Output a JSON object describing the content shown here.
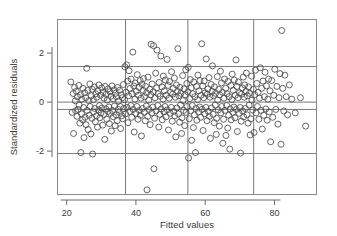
{
  "chart_data": {
    "type": "scatter",
    "title": "",
    "subtitle": "",
    "xlabel": "Fitted values",
    "ylabel": "Standardized residuals",
    "xlim": [
      17.5,
      92.0
    ],
    "ylim": [
      -3.75,
      3.35
    ],
    "xticks": [
      20,
      40,
      60,
      80
    ],
    "xtick_labels": [
      "20",
      "40",
      "60",
      "80"
    ],
    "yticks": [
      2,
      0,
      -2
    ],
    "ytick_labels": [
      "2",
      "0",
      "-2"
    ],
    "grid": true,
    "grid_vertical_x": [
      37,
      55,
      74
    ],
    "grid_horizontal_y": [
      1.45,
      0.0,
      -0.3,
      -2.1
    ],
    "legend": null,
    "legend_position": "none",
    "marker": "open-circle",
    "marker_size": 3,
    "marker_color": "#4a4a4a",
    "frame_color": "#8a8a8a",
    "grid_color": "#7a7a7a",
    "axis_color": "#6a6a6a",
    "n_points": 392,
    "points": [
      [
        21.2,
        0.82
      ],
      [
        21.6,
        -0.42
      ],
      [
        21.9,
        0.35
      ],
      [
        22.0,
        -1.28
      ],
      [
        22.3,
        0.6
      ],
      [
        22.5,
        0.05
      ],
      [
        22.6,
        -0.35
      ],
      [
        22.8,
        0.44
      ],
      [
        23.0,
        -0.58
      ],
      [
        23.1,
        0.22
      ],
      [
        23.3,
        -0.3
      ],
      [
        23.5,
        0.68
      ],
      [
        23.6,
        -0.12
      ],
      [
        23.8,
        -0.86
      ],
      [
        24.0,
        0.3
      ],
      [
        24.1,
        -2.06
      ],
      [
        24.3,
        -0.48
      ],
      [
        24.4,
        0.12
      ],
      [
        24.6,
        -0.72
      ],
      [
        24.7,
        0.56
      ],
      [
        24.9,
        -0.22
      ],
      [
        25.0,
        -1.45
      ],
      [
        25.2,
        0.38
      ],
      [
        25.3,
        -0.62
      ],
      [
        25.5,
        0.18
      ],
      [
        25.6,
        -0.92
      ],
      [
        25.8,
        1.38
      ],
      [
        25.9,
        -0.34
      ],
      [
        26.1,
        0.48
      ],
      [
        26.2,
        -1.12
      ],
      [
        26.4,
        0.06
      ],
      [
        26.5,
        -0.54
      ],
      [
        26.7,
        0.74
      ],
      [
        26.8,
        -0.18
      ],
      [
        27.0,
        -1.3
      ],
      [
        27.1,
        0.26
      ],
      [
        27.3,
        -0.66
      ],
      [
        27.4,
        0.52
      ],
      [
        27.5,
        -2.12
      ],
      [
        27.7,
        0.1
      ],
      [
        27.8,
        -0.4
      ],
      [
        28.0,
        0.62
      ],
      [
        28.1,
        -0.26
      ],
      [
        28.3,
        -0.8
      ],
      [
        28.4,
        0.34
      ],
      [
        28.6,
        -0.56
      ],
      [
        28.7,
        0.2
      ],
      [
        28.9,
        -1.02
      ],
      [
        29.0,
        0.46
      ],
      [
        29.2,
        -0.32
      ],
      [
        29.3,
        0.7
      ],
      [
        29.5,
        -0.14
      ],
      [
        29.6,
        -0.64
      ],
      [
        29.8,
        0.28
      ],
      [
        29.9,
        -0.44
      ],
      [
        30.1,
        0.58
      ],
      [
        30.2,
        -0.24
      ],
      [
        30.4,
        -0.94
      ],
      [
        30.5,
        0.4
      ],
      [
        30.7,
        -0.5
      ],
      [
        30.8,
        0.16
      ],
      [
        31.0,
        -1.52
      ],
      [
        31.1,
        0.64
      ],
      [
        31.3,
        -0.28
      ],
      [
        31.4,
        0.32
      ],
      [
        31.6,
        -0.7
      ],
      [
        31.7,
        0.08
      ],
      [
        31.9,
        -0.38
      ],
      [
        32.0,
        0.54
      ],
      [
        32.2,
        -0.2
      ],
      [
        32.3,
        -0.88
      ],
      [
        32.5,
        0.42
      ],
      [
        32.6,
        -0.46
      ],
      [
        32.8,
        0.24
      ],
      [
        32.9,
        -1.18
      ],
      [
        33.1,
        0.66
      ],
      [
        33.2,
        -0.34
      ],
      [
        33.4,
        0.14
      ],
      [
        33.5,
        -0.6
      ],
      [
        33.7,
        0.5
      ],
      [
        33.8,
        -0.16
      ],
      [
        34.0,
        -0.96
      ],
      [
        34.1,
        0.36
      ],
      [
        34.3,
        -0.52
      ],
      [
        34.4,
        0.22
      ],
      [
        34.6,
        -0.76
      ],
      [
        34.7,
        0.6
      ],
      [
        34.9,
        -0.3
      ],
      [
        35.0,
        0.04
      ],
      [
        35.2,
        -0.42
      ],
      [
        35.3,
        0.48
      ],
      [
        35.5,
        -0.18
      ],
      [
        35.6,
        -1.08
      ],
      [
        35.8,
        0.3
      ],
      [
        35.9,
        -0.56
      ],
      [
        36.1,
        0.18
      ],
      [
        36.2,
        -0.68
      ],
      [
        36.4,
        0.72
      ],
      [
        36.5,
        -0.26
      ],
      [
        36.7,
        0.1
      ],
      [
        36.8,
        1.44
      ],
      [
        37.0,
        -0.48
      ],
      [
        37.1,
        0.4
      ],
      [
        37.3,
        1.52
      ],
      [
        37.4,
        -0.22
      ],
      [
        37.6,
        0.86
      ],
      [
        37.7,
        -0.84
      ],
      [
        37.9,
        0.26
      ],
      [
        38.0,
        1.28
      ],
      [
        38.2,
        -0.38
      ],
      [
        38.3,
        0.56
      ],
      [
        38.5,
        -0.14
      ],
      [
        38.6,
        0.94
      ],
      [
        38.8,
        -0.62
      ],
      [
        38.9,
        0.34
      ],
      [
        39.1,
        2.04
      ],
      [
        39.2,
        -0.3
      ],
      [
        39.4,
        0.66
      ],
      [
        39.5,
        -1.22
      ],
      [
        39.7,
        0.12
      ],
      [
        39.8,
        0.78
      ],
      [
        40.0,
        -0.46
      ],
      [
        40.1,
        0.44
      ],
      [
        40.3,
        -0.18
      ],
      [
        40.4,
        1.12
      ],
      [
        40.6,
        -0.7
      ],
      [
        40.7,
        0.28
      ],
      [
        40.9,
        0.6
      ],
      [
        41.0,
        -0.34
      ],
      [
        41.2,
        0.88
      ],
      [
        41.3,
        -0.54
      ],
      [
        41.5,
        0.16
      ],
      [
        41.6,
        -1.38
      ],
      [
        41.8,
        0.72
      ],
      [
        41.9,
        -0.26
      ],
      [
        42.1,
        0.48
      ],
      [
        42.2,
        0.96
      ],
      [
        42.4,
        -0.42
      ],
      [
        42.5,
        0.22
      ],
      [
        42.7,
        -0.76
      ],
      [
        42.8,
        0.64
      ],
      [
        43.0,
        -0.16
      ],
      [
        43.1,
        0.38
      ],
      [
        43.2,
        -3.58
      ],
      [
        43.4,
        -0.58
      ],
      [
        43.5,
        1.02
      ],
      [
        43.7,
        0.08
      ],
      [
        43.8,
        -0.3
      ],
      [
        44.0,
        0.52
      ],
      [
        44.1,
        -0.92
      ],
      [
        44.3,
        0.3
      ],
      [
        44.4,
        2.36
      ],
      [
        44.6,
        -0.44
      ],
      [
        44.7,
        0.74
      ],
      [
        44.9,
        -0.2
      ],
      [
        45.0,
        0.42
      ],
      [
        45.1,
        2.3
      ],
      [
        45.2,
        -2.72
      ],
      [
        45.4,
        -0.66
      ],
      [
        45.5,
        0.18
      ],
      [
        45.7,
        1.18
      ],
      [
        45.8,
        -0.36
      ],
      [
        46.0,
        0.58
      ],
      [
        46.1,
        2.12
      ],
      [
        46.3,
        -0.14
      ],
      [
        46.4,
        0.34
      ],
      [
        46.6,
        -1.02
      ],
      [
        46.7,
        0.8
      ],
      [
        46.9,
        -0.5
      ],
      [
        47.0,
        0.24
      ],
      [
        47.2,
        1.88
      ],
      [
        47.3,
        -0.28
      ],
      [
        47.5,
        0.62
      ],
      [
        47.6,
        -0.72
      ],
      [
        47.8,
        0.12
      ],
      [
        47.9,
        1.06
      ],
      [
        48.1,
        -0.4
      ],
      [
        48.2,
        0.46
      ],
      [
        48.4,
        -0.18
      ],
      [
        48.5,
        0.9
      ],
      [
        48.7,
        -0.6
      ],
      [
        48.8,
        0.28
      ],
      [
        49.0,
        1.74
      ],
      [
        49.1,
        -0.32
      ],
      [
        49.3,
        0.68
      ],
      [
        49.4,
        -1.14
      ],
      [
        49.6,
        0.16
      ],
      [
        49.7,
        0.84
      ],
      [
        49.9,
        -0.46
      ],
      [
        50.0,
        0.4
      ],
      [
        50.2,
        -0.22
      ],
      [
        50.3,
        1.24
      ],
      [
        50.5,
        -0.78
      ],
      [
        50.6,
        0.32
      ],
      [
        50.8,
        0.56
      ],
      [
        50.9,
        -0.38
      ],
      [
        51.1,
        0.98
      ],
      [
        51.2,
        -0.56
      ],
      [
        51.4,
        0.2
      ],
      [
        51.5,
        -1.42
      ],
      [
        51.7,
        0.7
      ],
      [
        51.8,
        -0.24
      ],
      [
        52.0,
        0.44
      ],
      [
        52.1,
        2.18
      ],
      [
        52.3,
        -0.48
      ],
      [
        52.4,
        0.26
      ],
      [
        52.6,
        -0.82
      ],
      [
        52.7,
        0.6
      ],
      [
        52.9,
        -0.12
      ],
      [
        53.0,
        0.36
      ],
      [
        53.2,
        -1.28
      ],
      [
        53.3,
        -0.64
      ],
      [
        53.5,
        1.08
      ],
      [
        53.6,
        0.06
      ],
      [
        53.8,
        -0.34
      ],
      [
        53.9,
        0.54
      ],
      [
        54.1,
        -0.96
      ],
      [
        54.2,
        0.3
      ],
      [
        54.4,
        1.32
      ],
      [
        54.5,
        -0.42
      ],
      [
        54.7,
        0.76
      ],
      [
        54.8,
        -0.18
      ],
      [
        55.0,
        0.42
      ],
      [
        55.1,
        1.42
      ],
      [
        55.2,
        -2.28
      ],
      [
        55.4,
        -0.68
      ],
      [
        55.5,
        0.14
      ],
      [
        55.7,
        0.92
      ],
      [
        55.8,
        -0.36
      ],
      [
        56.0,
        0.58
      ],
      [
        56.1,
        -1.56
      ],
      [
        56.3,
        -0.14
      ],
      [
        56.4,
        0.34
      ],
      [
        56.6,
        -1.04
      ],
      [
        56.7,
        0.82
      ],
      [
        56.9,
        -0.52
      ],
      [
        57.0,
        0.22
      ],
      [
        57.2,
        -2.06
      ],
      [
        57.3,
        -0.26
      ],
      [
        57.5,
        0.64
      ],
      [
        57.6,
        -0.74
      ],
      [
        57.8,
        0.1
      ],
      [
        57.9,
        1.1
      ],
      [
        58.1,
        -0.4
      ],
      [
        58.2,
        0.46
      ],
      [
        58.4,
        -0.2
      ],
      [
        58.5,
        0.88
      ],
      [
        58.7,
        -0.62
      ],
      [
        58.8,
        0.28
      ],
      [
        59.0,
        2.38
      ],
      [
        59.1,
        -0.3
      ],
      [
        59.3,
        0.66
      ],
      [
        59.4,
        -1.16
      ],
      [
        59.6,
        0.18
      ],
      [
        59.7,
        0.86
      ],
      [
        59.9,
        -0.48
      ],
      [
        60.0,
        0.38
      ],
      [
        60.2,
        -0.22
      ],
      [
        60.3,
        1.76
      ],
      [
        60.5,
        -0.76
      ],
      [
        60.6,
        0.32
      ],
      [
        60.8,
        0.54
      ],
      [
        60.9,
        -0.38
      ],
      [
        61.1,
        1.0
      ],
      [
        61.2,
        -0.58
      ],
      [
        61.4,
        0.2
      ],
      [
        61.5,
        -1.48
      ],
      [
        61.7,
        0.72
      ],
      [
        61.8,
        -0.24
      ],
      [
        62.0,
        0.44
      ],
      [
        62.1,
        1.48
      ],
      [
        62.3,
        -0.5
      ],
      [
        62.4,
        0.26
      ],
      [
        62.6,
        -0.84
      ],
      [
        62.7,
        0.62
      ],
      [
        62.9,
        -0.12
      ],
      [
        63.0,
        0.36
      ],
      [
        63.2,
        -1.32
      ],
      [
        63.3,
        -0.66
      ],
      [
        63.5,
        1.04
      ],
      [
        63.6,
        0.08
      ],
      [
        63.8,
        -0.32
      ],
      [
        63.9,
        0.52
      ],
      [
        64.1,
        -0.98
      ],
      [
        64.2,
        0.3
      ],
      [
        64.4,
        1.26
      ],
      [
        64.5,
        -0.44
      ],
      [
        64.7,
        0.78
      ],
      [
        64.8,
        -0.18
      ],
      [
        65.0,
        0.4
      ],
      [
        65.1,
        -1.68
      ],
      [
        65.3,
        -0.7
      ],
      [
        65.4,
        0.16
      ],
      [
        65.6,
        0.94
      ],
      [
        65.7,
        -0.34
      ],
      [
        65.9,
        0.56
      ],
      [
        66.0,
        -1.36
      ],
      [
        66.2,
        -0.14
      ],
      [
        66.3,
        0.34
      ],
      [
        66.5,
        -1.06
      ],
      [
        66.6,
        0.84
      ],
      [
        66.8,
        -0.54
      ],
      [
        66.9,
        0.22
      ],
      [
        67.1,
        -1.92
      ],
      [
        67.2,
        -0.28
      ],
      [
        67.4,
        0.68
      ],
      [
        67.5,
        -0.72
      ],
      [
        67.7,
        0.1
      ],
      [
        67.8,
        1.14
      ],
      [
        68.0,
        -0.42
      ],
      [
        68.1,
        0.48
      ],
      [
        68.3,
        -0.2
      ],
      [
        68.4,
        0.9
      ],
      [
        68.6,
        -0.64
      ],
      [
        68.7,
        0.28
      ],
      [
        68.9,
        1.72
      ],
      [
        69.0,
        -0.3
      ],
      [
        69.2,
        0.64
      ],
      [
        69.3,
        -1.2
      ],
      [
        69.5,
        0.18
      ],
      [
        69.6,
        0.82
      ],
      [
        69.8,
        -0.46
      ],
      [
        69.9,
        0.38
      ],
      [
        70.1,
        -0.22
      ],
      [
        70.2,
        -2.08
      ],
      [
        70.4,
        -0.78
      ],
      [
        70.5,
        0.32
      ],
      [
        70.7,
        0.58
      ],
      [
        70.8,
        -0.36
      ],
      [
        71.0,
        1.02
      ],
      [
        71.1,
        -0.6
      ],
      [
        71.3,
        0.2
      ],
      [
        71.4,
        0.7
      ],
      [
        71.6,
        -0.26
      ],
      [
        71.8,
        0.44
      ],
      [
        71.9,
        1.18
      ],
      [
        72.1,
        -0.52
      ],
      [
        72.2,
        0.26
      ],
      [
        72.4,
        -0.86
      ],
      [
        72.5,
        0.62
      ],
      [
        72.7,
        -0.12
      ],
      [
        72.8,
        0.36
      ],
      [
        73.0,
        -1.34
      ],
      [
        73.2,
        -0.68
      ],
      [
        73.4,
        1.06
      ],
      [
        73.5,
        0.08
      ],
      [
        73.7,
        -0.32
      ],
      [
        73.9,
        0.52
      ],
      [
        74.1,
        -1.24
      ],
      [
        74.3,
        0.3
      ],
      [
        74.5,
        1.3
      ],
      [
        74.7,
        -0.44
      ],
      [
        74.9,
        0.76
      ],
      [
        75.1,
        -0.18
      ],
      [
        75.3,
        0.4
      ],
      [
        75.5,
        -0.7
      ],
      [
        75.7,
        0.16
      ],
      [
        75.9,
        1.4
      ],
      [
        76.1,
        -0.34
      ],
      [
        76.3,
        0.56
      ],
      [
        76.5,
        -1.1
      ],
      [
        76.7,
        0.86
      ],
      [
        76.9,
        -0.54
      ],
      [
        77.1,
        0.22
      ],
      [
        77.3,
        1.22
      ],
      [
        77.5,
        -0.28
      ],
      [
        77.7,
        0.66
      ],
      [
        77.9,
        -0.74
      ],
      [
        78.1,
        0.12
      ],
      [
        78.3,
        0.94
      ],
      [
        78.5,
        -0.4
      ],
      [
        78.7,
        0.46
      ],
      [
        78.9,
        -1.62
      ],
      [
        79.2,
        0.88
      ],
      [
        79.5,
        -0.62
      ],
      [
        79.8,
        0.28
      ],
      [
        80.1,
        1.34
      ],
      [
        80.4,
        -0.3
      ],
      [
        80.7,
        0.64
      ],
      [
        81.0,
        -0.9
      ],
      [
        81.3,
        0.18
      ],
      [
        81.6,
        1.16
      ],
      [
        81.9,
        -1.72
      ],
      [
        82.1,
        2.92
      ],
      [
        82.4,
        0.56
      ],
      [
        82.7,
        -0.36
      ],
      [
        83.0,
        1.1
      ],
      [
        83.4,
        0.22
      ],
      [
        83.8,
        -0.52
      ],
      [
        84.3,
        0.7
      ],
      [
        85.0,
        0.12
      ],
      [
        86.0,
        -0.44
      ],
      [
        87.5,
        0.18
      ],
      [
        89.0,
        -0.98
      ]
    ]
  }
}
